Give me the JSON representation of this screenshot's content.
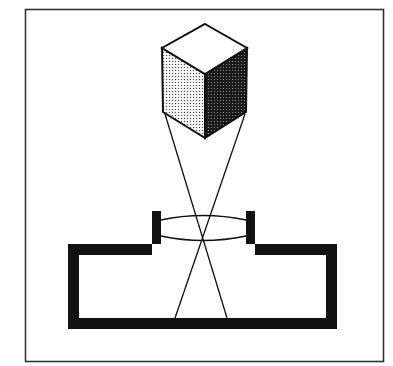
{
  "diagram": {
    "title": "",
    "elements": {
      "frame": {
        "label": ""
      },
      "object": {
        "label": "",
        "shape": "cube"
      },
      "lens": {
        "label": ""
      },
      "camera_body": {
        "label": ""
      },
      "rays": {
        "label": "",
        "count": 2
      }
    },
    "colors": {
      "ink": "#111111",
      "paper": "#ffffff",
      "frame": "#333333",
      "cube_left_face": "#cfcfcf",
      "cube_right_face": "#3a3a3a",
      "cube_top_face": "#ffffff"
    }
  }
}
